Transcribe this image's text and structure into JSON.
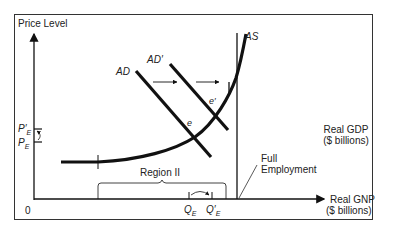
{
  "diagram": {
    "type": "aggregate-demand-aggregate-supply",
    "y_axis_label": "Price Level",
    "x_axis_label_line1": "Real GNP",
    "x_axis_label_line2": "($ billions)",
    "side_label_line1": "Real GDP",
    "side_label_line2": "($ billions)",
    "origin_label": "0",
    "curves": {
      "ad": "AD",
      "ad_prime": "AD′",
      "as": "AS"
    },
    "equilibria": {
      "e": "e",
      "e_prime": "e′"
    },
    "price_labels": {
      "pe": "P",
      "pe_sub": "E",
      "pe_prime": "P′",
      "pe_prime_sub": "E"
    },
    "quantity_labels": {
      "qe": "Q",
      "qe_sub": "E",
      "qe_prime": "Q′",
      "qe_prime_sub": "E"
    },
    "region_label": "Region II",
    "full_employment_line1": "Full",
    "full_employment_line2": "Employment",
    "colors": {
      "line": "#111111",
      "frame": "#333333",
      "background": "#ffffff"
    }
  }
}
